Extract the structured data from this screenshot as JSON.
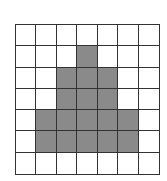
{
  "grid": {
    "rows": 7,
    "cols": 7,
    "fill_color": "#8a8a8a",
    "empty_color": "#ffffff",
    "line_color": "#333333",
    "cells": [
      [
        0,
        0,
        0,
        0,
        0,
        0,
        0
      ],
      [
        0,
        0,
        0,
        1,
        0,
        0,
        0
      ],
      [
        0,
        0,
        1,
        1,
        1,
        0,
        0
      ],
      [
        0,
        0,
        1,
        1,
        1,
        0,
        0
      ],
      [
        0,
        1,
        1,
        1,
        1,
        1,
        0
      ],
      [
        0,
        1,
        1,
        1,
        1,
        1,
        0
      ],
      [
        0,
        0,
        0,
        0,
        0,
        0,
        0
      ]
    ]
  }
}
